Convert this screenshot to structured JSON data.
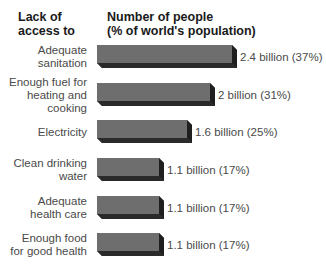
{
  "header": {
    "left_line1": "Lack of",
    "left_line2": "access to",
    "right_line1": "Number of people",
    "right_line2": "(% of world's population)"
  },
  "colors": {
    "bar_top": "#6e6e6e",
    "bar_front": "#4a4a4a",
    "bar_bottom": "#2a2a2a",
    "bar_side": "#1f1f1f"
  },
  "rows": [
    {
      "label_l1": "Adequate",
      "label_l2": "sanitation",
      "label_l3": "",
      "value": "2.4 billion (37%)"
    },
    {
      "label_l1": "Enough fuel for",
      "label_l2": "heating and",
      "label_l3": "cooking",
      "value": "2 billion (31%)"
    },
    {
      "label_l1": "Electricity",
      "label_l2": "",
      "label_l3": "",
      "value": "1.6 billion (25%)"
    },
    {
      "label_l1": "Clean drinking",
      "label_l2": "water",
      "label_l3": "",
      "value": "1.1 billion (17%)"
    },
    {
      "label_l1": "Adequate",
      "label_l2": "health care",
      "label_l3": "",
      "value": "1.1 billion (17%)"
    },
    {
      "label_l1": "Enough food",
      "label_l2": "for good health",
      "label_l3": "",
      "value": "1.1 billion (17%)"
    }
  ],
  "chart_data": {
    "type": "bar",
    "orientation": "horizontal",
    "title": "",
    "xlabel": "Number of people (% of world's population)",
    "ylabel": "Lack of access to",
    "categories": [
      "Adequate sanitation",
      "Enough fuel for heating and cooking",
      "Electricity",
      "Clean drinking water",
      "Adequate health care",
      "Enough food for good health"
    ],
    "values_billion": [
      2.4,
      2.0,
      1.6,
      1.1,
      1.1,
      1.1
    ],
    "values_percent": [
      37,
      31,
      25,
      17,
      17,
      17
    ],
    "data_labels": [
      "2.4 billion (37%)",
      "2 billion (31%)",
      "1.6 billion (25%)",
      "1.1 billion (17%)",
      "1.1 billion (17%)",
      "1.1 billion (17%)"
    ],
    "grid": false,
    "legend": "none",
    "style": "3d-bars"
  }
}
